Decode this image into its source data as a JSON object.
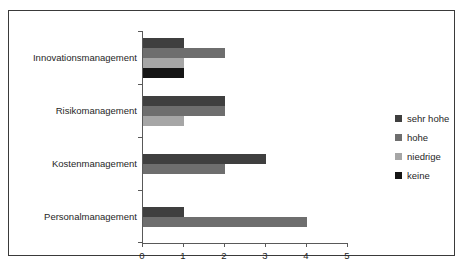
{
  "chart_data": {
    "type": "bar",
    "orientation": "horizontal",
    "title": "",
    "xlabel": "",
    "ylabel": "",
    "categories": [
      "Innovationsmanagement",
      "Risikomanagement",
      "Kostenmanagement",
      "Personalmanagement"
    ],
    "series": [
      {
        "name": "sehr hohe",
        "color": "#3f3f3f",
        "values": [
          1,
          2,
          3,
          1
        ]
      },
      {
        "name": "hohe",
        "color": "#6e6e6e",
        "values": [
          2,
          2,
          2,
          4
        ]
      },
      {
        "name": "niedrige",
        "color": "#a6a6a6",
        "values": [
          1,
          1,
          0,
          0
        ]
      },
      {
        "name": "keine",
        "color": "#151515",
        "values": [
          1,
          0,
          0,
          0
        ]
      }
    ],
    "xlim": [
      0,
      5
    ],
    "xticks": [
      "0",
      "1",
      "2",
      "3",
      "4",
      "5"
    ],
    "grid": false,
    "legend_position": "right",
    "axis_color": "#595959",
    "frame_color": "#3a3a3a",
    "background": "#ffffff"
  },
  "legend": {
    "items": [
      {
        "label": "sehr hohe"
      },
      {
        "label": "hohe"
      },
      {
        "label": "niedrige"
      },
      {
        "label": "keine"
      }
    ]
  }
}
